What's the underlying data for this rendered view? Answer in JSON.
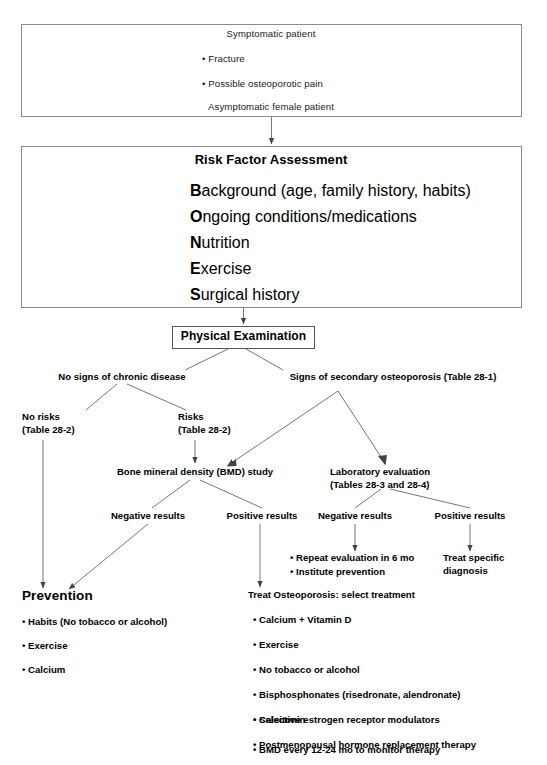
{
  "meta": {
    "line_color": "#6e6e6e",
    "box_color": "#8a8a8a",
    "text_color": "#000000"
  },
  "intake_box": {
    "line1": "Symptomatic patient",
    "bullets": [
      "Fracture",
      "Possible osteoporotic pain"
    ],
    "line2": "Asymptomatic female patient"
  },
  "risk_box": {
    "heading": "Risk Factor Assessment",
    "items": [
      {
        "initial": "B",
        "rest": "ackground (age, family history, habits)"
      },
      {
        "initial": "O",
        "rest": "ngoing conditions/medications"
      },
      {
        "initial": "N",
        "rest": "utrition"
      },
      {
        "initial": "E",
        "rest": "xercise"
      },
      {
        "initial": "S",
        "rest": "urgical history"
      }
    ]
  },
  "physical_exam": {
    "label": "Physical Examination"
  },
  "branches": {
    "no_signs": "No signs of chronic disease",
    "signs": "Signs of secondary osteoporosis (Table 28-1)",
    "no_risks_l1": "No risks",
    "no_risks_l2": "(Table 28-2)",
    "risks_l1": "Risks",
    "risks_l2": "(Table 28-2)"
  },
  "studies": {
    "bmd": "Bone mineral density (BMD) study",
    "lab_l1": "Laboratory evaluation",
    "lab_l2": "(Tables 28-3 and 28-4)"
  },
  "results": {
    "bmd_negative": "Negative results",
    "bmd_positive": "Positive results",
    "lab_negative": "Negative results",
    "lab_positive": "Positive results"
  },
  "lab_negative_actions": [
    "Repeat evaluation in 6 mo",
    "Institute prevention"
  ],
  "lab_positive_action": {
    "line1": "Treat specific",
    "line2": "diagnosis"
  },
  "prevention": {
    "heading": "Prevention",
    "items": [
      "Habits (No tobacco or alcohol)",
      "Exercise",
      "Calcium"
    ]
  },
  "treatment": {
    "heading": "Treat Osteoporosis: select treatment",
    "items": [
      "Calcium + Vitamin D",
      "Exercise",
      "No tobacco or alcohol",
      "Bisphosphonates (risedronate, alendronate)",
      "Calcitonin",
      "Selective estrogen receptor modulators",
      "Postmenopausal hormone replacement therapy",
      "BMD every 12-24 mo to monitor therapy"
    ]
  }
}
